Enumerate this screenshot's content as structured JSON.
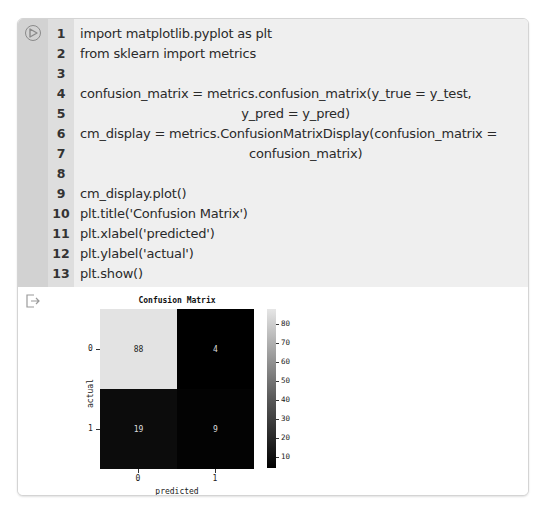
{
  "notebook_cell": {
    "run_button": {
      "icon": "play-circle-icon"
    },
    "lines": [
      {
        "number": "1",
        "code": "import matplotlib.pyplot as plt"
      },
      {
        "number": "2",
        "code": "from sklearn import metrics"
      },
      {
        "number": "3",
        "code": ""
      },
      {
        "number": "4",
        "code": "confusion_matrix = metrics.confusion_matrix(y_true = y_test,"
      },
      {
        "number": "5",
        "code": "                                         y_pred = y_pred)"
      },
      {
        "number": "6",
        "code": "cm_display = metrics.ConfusionMatrixDisplay(confusion_matrix ="
      },
      {
        "number": "7",
        "code": "                                           confusion_matrix)"
      },
      {
        "number": "8",
        "code": ""
      },
      {
        "number": "9",
        "code": "cm_display.plot()"
      },
      {
        "number": "10",
        "code": "plt.title('Confusion Matrix')"
      },
      {
        "number": "11",
        "code": "plt.xlabel('predicted')"
      },
      {
        "number": "12",
        "code": "plt.ylabel('actual')"
      },
      {
        "number": "13",
        "code": "plt.show()"
      }
    ],
    "output": {
      "icon": "output-arrow-icon"
    }
  },
  "chart_data": {
    "type": "heatmap",
    "title": "Confusion Matrix",
    "xlabel": "predicted",
    "ylabel": "actual",
    "x_ticks": [
      "0",
      "1"
    ],
    "y_ticks": [
      "0",
      "1"
    ],
    "matrix": [
      [
        88,
        4
      ],
      [
        19,
        9
      ]
    ],
    "colorbar": {
      "ticks": [
        "80",
        "70",
        "60",
        "50",
        "40",
        "30",
        "20",
        "10"
      ],
      "range": [
        4,
        88
      ],
      "cmap": "gray"
    },
    "grid": false
  }
}
